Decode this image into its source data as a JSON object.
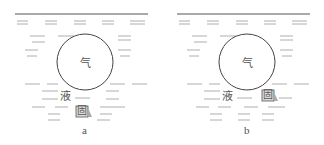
{
  "panels": [
    {
      "id": "a",
      "caption": "a",
      "labels": {
        "gas": "气",
        "liquid": "液",
        "solid": "固"
      },
      "description": "Gas bubble suspended in liquid; solid particle below, separated from bubble"
    },
    {
      "id": "b",
      "caption": "b",
      "labels": {
        "gas": "气",
        "liquid": "液",
        "solid": "固"
      },
      "description": "Gas bubble in liquid with solid particle attached at lower right of bubble"
    }
  ],
  "colors": {
    "line": "#444444",
    "dash": "#9a9a9a",
    "text": "#555555"
  }
}
